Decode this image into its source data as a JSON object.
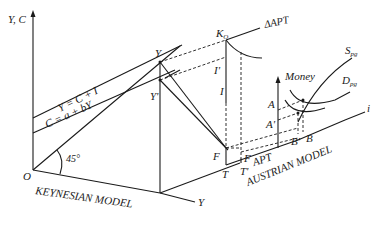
{
  "diagram": {
    "axes": {
      "vertical_label": "Y, C",
      "origin_label": "O",
      "horizontal_label": "Y",
      "money_axis_label": "Money",
      "interest_axis_label": "i"
    },
    "lines": {
      "equilibrium": "Y = C + I",
      "consumption": "C = a + bY",
      "angle": "45°",
      "delta_apt": "ΔAPT",
      "apt": "APT"
    },
    "points": {
      "Y": "Y",
      "Y_prime": "Y'",
      "K_o": "K",
      "K_o_sub": "O",
      "I_prime": "I'",
      "I": "I",
      "F_left": "F",
      "F_right": "F",
      "T": "T",
      "T_prime": "T'",
      "A": "A",
      "A_prime": "A'",
      "B_prime": "B'",
      "B": "B"
    },
    "curves": {
      "supply": "S",
      "supply_sub": "pg",
      "demand": "D",
      "demand_sub": "pg"
    },
    "model_labels": {
      "keynesian": "KEYNESIAN MODEL",
      "austrian": "AUSTRIAN MODEL"
    }
  }
}
